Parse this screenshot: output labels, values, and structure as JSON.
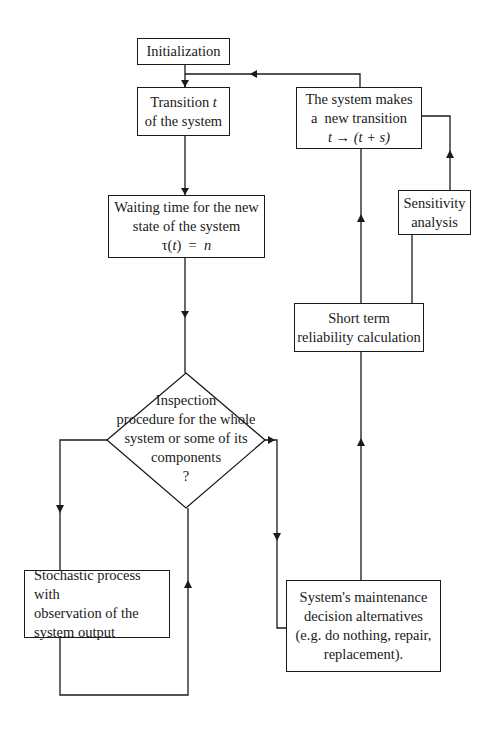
{
  "diagram": {
    "type": "flowchart",
    "nodes": {
      "initialization": {
        "label": "Initialization"
      },
      "transition": {
        "line1": "Transition ",
        "line1_var": "t",
        "line2": "of the system"
      },
      "waiting": {
        "line1": "Waiting time for the new",
        "line2": "state of the system",
        "formula_lhs": "τ(",
        "formula_var": "t",
        "formula_mid": ")  =  ",
        "formula_rhs": "n"
      },
      "inspection": {
        "line1": "Inspection",
        "line2": "procedure for the whole",
        "line3": "system or some of its",
        "line4": "components",
        "line5": "?"
      },
      "stochastic": {
        "line1": "Stochastic process with",
        "line2": "observation of the",
        "line3": "system output"
      },
      "maintenance": {
        "line1": "System's maintenance",
        "line2": "decision alternatives",
        "line3": "(e.g. do nothing, repair,",
        "line4": "replacement)."
      },
      "short_term": {
        "line1": "Short term",
        "line2": "reliability calculation"
      },
      "sensitivity": {
        "line1": "Sensitivity",
        "line2": "analysis"
      },
      "new_transition": {
        "line1": "The system makes",
        "line2": "a  new transition",
        "formula": "t → (t + s)"
      }
    },
    "edges": [
      {
        "from": "initialization",
        "to": "transition"
      },
      {
        "from": "transition",
        "to": "waiting"
      },
      {
        "from": "waiting",
        "to": "inspection"
      },
      {
        "from": "inspection",
        "to": "stochastic"
      },
      {
        "from": "stochastic",
        "to": "inspection"
      },
      {
        "from": "inspection",
        "to": "maintenance"
      },
      {
        "from": "maintenance",
        "to": "short_term"
      },
      {
        "from": "short_term",
        "to": "new_transition"
      },
      {
        "from": "short_term",
        "to": "sensitivity"
      },
      {
        "from": "sensitivity",
        "to": "new_transition"
      },
      {
        "from": "new_transition",
        "to": "transition"
      }
    ]
  }
}
